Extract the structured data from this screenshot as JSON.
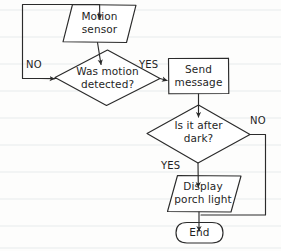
{
  "diagram": {
    "style": "hand-drawn flowchart on faintly ruled notebook paper",
    "stroke_color": "#2b2b2b",
    "shape_fill": "#ffffff",
    "paper_color": "#fdfdfc",
    "rule_line_color": "#eef0f2",
    "rule_line_spacing": 27
  },
  "nodes": [
    {
      "id": "motion-sensor",
      "shape": "parallelogram",
      "role": "input",
      "label": "Motion\nsensor",
      "x": 63,
      "y": 4,
      "w": 73,
      "h": 39
    },
    {
      "id": "was-motion-detected",
      "shape": "diamond",
      "role": "decision",
      "label": "Was motion\ndetected?",
      "x": 55,
      "y": 50,
      "w": 105,
      "h": 56
    },
    {
      "id": "send-message",
      "shape": "rectangle",
      "role": "process",
      "label": "Send\nmessage",
      "x": 168,
      "y": 58,
      "w": 61,
      "h": 36
    },
    {
      "id": "is-it-after-dark",
      "shape": "diamond",
      "role": "decision",
      "label": "Is it after\ndark?",
      "x": 147,
      "y": 105,
      "w": 103,
      "h": 58
    },
    {
      "id": "display-porch-light",
      "shape": "parallelogram",
      "role": "output",
      "label": "Display\nporch light",
      "x": 167,
      "y": 175,
      "w": 74,
      "h": 37
    },
    {
      "id": "end",
      "shape": "terminator",
      "role": "terminator",
      "label": "End",
      "x": 176,
      "y": 222,
      "w": 47,
      "h": 21
    }
  ],
  "edge_labels": [
    {
      "id": "no-motion",
      "text": "NO",
      "x": 26,
      "y": 60
    },
    {
      "id": "yes-motion",
      "text": "YES",
      "x": 139,
      "y": 60
    },
    {
      "id": "no-dark",
      "text": "NO",
      "x": 250,
      "y": 116
    },
    {
      "id": "yes-dark",
      "text": "YES",
      "x": 161,
      "y": 160
    }
  ],
  "edges": [
    {
      "id": "motion-to-decision",
      "from": "motion-sensor",
      "to": "was-motion-detected",
      "label": ""
    },
    {
      "id": "decision-no-loopback",
      "from": "was-motion-detected",
      "to": "motion-sensor",
      "label": "NO"
    },
    {
      "id": "decision-yes-to-send",
      "from": "was-motion-detected",
      "to": "send-message",
      "label": "YES"
    },
    {
      "id": "send-to-dark",
      "from": "send-message",
      "to": "is-it-after-dark",
      "label": ""
    },
    {
      "id": "dark-yes-to-display",
      "from": "is-it-after-dark",
      "to": "display-porch-light",
      "label": "YES"
    },
    {
      "id": "dark-no-to-end",
      "from": "is-it-after-dark",
      "to": "end",
      "label": "NO"
    },
    {
      "id": "display-to-end",
      "from": "display-porch-light",
      "to": "end",
      "label": ""
    }
  ]
}
